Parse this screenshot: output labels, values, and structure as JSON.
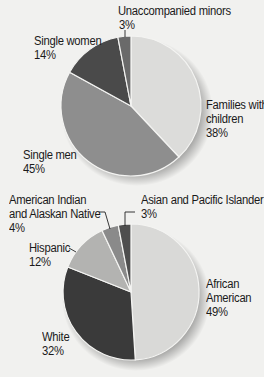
{
  "chart_data": [
    {
      "type": "pie",
      "title": "",
      "categories": [
        "Families with children",
        "Single men",
        "Single women",
        "Unaccompanied minors"
      ],
      "values": [
        38,
        45,
        14,
        3
      ],
      "unit": "%",
      "colors": [
        "#dcdcda",
        "#8e8e8e",
        "#4a4a4a",
        "#6a6a6a"
      ],
      "labels": [
        "Families with children 38%",
        "Single men 45%",
        "Single women 14%",
        "Unaccompanied minors 3%"
      ]
    },
    {
      "type": "pie",
      "title": "",
      "categories": [
        "African American",
        "White",
        "Hispanic",
        "American Indian and Alaskan Native",
        "Asian and Pacific Islander"
      ],
      "values": [
        49,
        32,
        12,
        4,
        3
      ],
      "unit": "%",
      "colors": [
        "#d9d9d7",
        "#3a3a3a",
        "#b3b3b1",
        "#8a8a8a",
        "#4e4e4e"
      ],
      "labels": [
        "African American 49%",
        "White 32%",
        "Hispanic 12%",
        "American Indian and Alaskan Native 4%",
        "Asian and Pacific Islander 3%"
      ]
    }
  ],
  "pie1": {
    "families": {
      "line1": "Families with",
      "line2": "children",
      "pct": "38%"
    },
    "single_men": {
      "line1": "Single men",
      "pct": "45%"
    },
    "single_women": {
      "line1": "Single women",
      "pct": "14%"
    },
    "minors": {
      "line1": "Unaccompanied minors",
      "pct": "3%"
    }
  },
  "pie2": {
    "african_american": {
      "line1": "African",
      "line2": "American",
      "pct": "49%"
    },
    "white": {
      "line1": "White",
      "pct": "32%"
    },
    "hispanic": {
      "line1": "Hispanic",
      "pct": "12%"
    },
    "american_indian": {
      "line1": "American Indian",
      "line2": "and Alaskan Native",
      "pct": "4%"
    },
    "asian": {
      "line1": "Asian and Pacific Islander",
      "pct": "3%"
    }
  }
}
